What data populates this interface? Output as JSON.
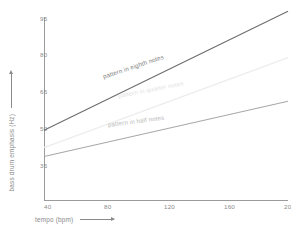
{
  "chart_data": {
    "type": "line",
    "title": "",
    "xlabel": "tempo (bpm)",
    "ylabel": "bass drum emphasis (Hz)",
    "xlim": [
      40,
      200
    ],
    "ylim": [
      32,
      95
    ],
    "xticks": [
      40,
      80,
      120,
      160,
      200
    ],
    "yticks": [
      35,
      50,
      65,
      80,
      95
    ],
    "grid": false,
    "legend": "inline-along-lines",
    "x": [
      40,
      200
    ],
    "series": [
      {
        "name": "pattern in eighth notes",
        "label": "pattern in eighth notes",
        "color": "#6d6d6d",
        "values": [
          56,
          97
        ]
      },
      {
        "name": "pattern in quarter notes",
        "label": "pattern in quarter notes",
        "color": "#ededed",
        "values": [
          50,
          81
        ]
      },
      {
        "name": "pattern in half notes",
        "label": "pattern in half notes",
        "color": "#a9a9a9",
        "values": [
          47,
          66
        ]
      }
    ]
  },
  "axes": {
    "x_title": "tempo (bpm)",
    "y_title": "bass drum emphasis (Hz)",
    "x_tick_labels": [
      "40",
      "80",
      "120",
      "160",
      "200"
    ],
    "y_tick_labels": [
      "95",
      "80",
      "65",
      "50",
      "35"
    ]
  },
  "colors": {
    "axis": "#9b9b9b",
    "tick_text": "#8a8a8a",
    "eighth": "#6d6d6d",
    "quarter": "#ededed",
    "half": "#a9a9a9",
    "background": "#ffffff"
  }
}
